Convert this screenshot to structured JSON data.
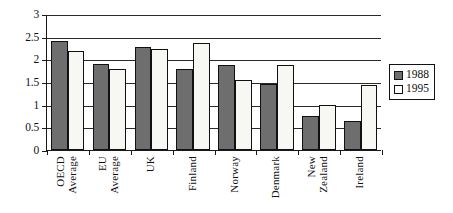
{
  "chart_data": {
    "type": "bar",
    "title": "",
    "subtitle": "",
    "xlabel": "",
    "ylabel": "",
    "ylim": [
      0,
      3
    ],
    "ytick_labels": [
      "3",
      "2.5",
      "2",
      "1.5",
      "1",
      "0.5",
      "0"
    ],
    "ytick_values": [
      3,
      2.5,
      2,
      1.5,
      1,
      0.5,
      0
    ],
    "grid": "horizontal",
    "legend_position": "right",
    "categories": [
      "OECD Average",
      "EU Average",
      "UK",
      "Finland",
      "Norway",
      "Denmark",
      "New Zealand",
      "Ireland"
    ],
    "category_lines": [
      [
        "OECD",
        "Average"
      ],
      [
        "EU",
        "Average"
      ],
      [
        "UK"
      ],
      [
        "Finland"
      ],
      [
        "Norway"
      ],
      [
        "Denmark"
      ],
      [
        "New",
        "Zealand"
      ],
      [
        "Ireland"
      ]
    ],
    "series": [
      {
        "name": "1988",
        "color": "#6e6e6e",
        "values": [
          2.4,
          1.9,
          2.28,
          1.78,
          1.88,
          1.45,
          0.74,
          0.63
        ]
      },
      {
        "name": "1995",
        "color": "#f7f7f4",
        "values": [
          2.18,
          1.78,
          2.22,
          2.37,
          1.55,
          1.88,
          1.0,
          1.43
        ]
      }
    ]
  },
  "legend": {
    "items": [
      {
        "label": "1988",
        "swatch": "filled-gray-swatch-icon"
      },
      {
        "label": "1995",
        "swatch": "empty-white-swatch-icon"
      }
    ]
  }
}
